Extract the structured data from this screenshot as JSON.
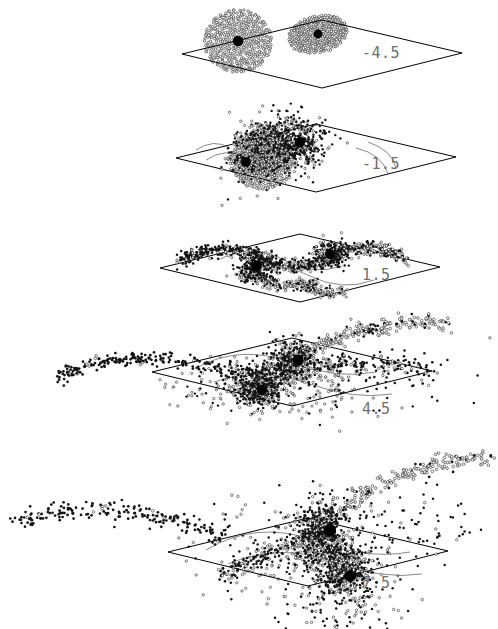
{
  "figure": {
    "kind": "n-body-galaxy-merger-sequence",
    "panel_count": 5,
    "background_color": "#ffffff",
    "ink_color": "#000000",
    "label_color": "#6e6e6e"
  },
  "panels": [
    {
      "id": "panel-1",
      "time_label": "-4.5",
      "label_x": 362,
      "label_y": 44,
      "stage_top": 0,
      "stage_height": 98,
      "plane": {
        "points": "182,54 322,20 462,53 322,88"
      },
      "orbits": [],
      "description": "two separate intact disk galaxies above the reference plane"
    },
    {
      "id": "panel-2",
      "time_label": "-1.5",
      "label_x": 362,
      "label_y": 155,
      "stage_top": 98,
      "stage_height": 112,
      "plane": {
        "points": "176,60 316,26 456,59 316,94"
      },
      "orbits": [
        "M 196,52 q 18,-12 34,-2",
        "M 206,62 q 20,-13 38,-3",
        "M 356,50 q 26,6 32,26",
        "M 368,44 q 24,8 28,26"
      ],
      "description": "disks merged into one overlapping blob with two dark cores"
    },
    {
      "id": "panel-3",
      "time_label": "1.5",
      "label_x": 362,
      "label_y": 266,
      "stage_top": 210,
      "stage_height": 108,
      "plane": {
        "points": "160,58 300,24 440,57 300,92"
      },
      "orbits": [
        "M 218,50 q 34,-18 66,0 q 30,16 58,6",
        "M 238,62 q 40,-12 72,4 q 32,16 64,4"
      ],
      "description": "tidal arms develop into an S-shaped pair of curved streams"
    },
    {
      "id": "panel-4",
      "time_label": "4.5",
      "label_x": 362,
      "label_y": 400,
      "stage_top": 310,
      "stage_height": 130,
      "plane": {
        "points": "152,62 292,28 432,61 292,96"
      },
      "orbits": [
        "M 196,58 q 44,-24 94,-6 q 46,18 86,10",
        "M 214,72 q 46,-16 96,2 q 44,16 82,10"
      ],
      "description": "long tidal tails extend far beyond the plane on both sides"
    },
    {
      "id": "panel-5",
      "time_label": "7.5",
      "label_x": 362,
      "label_y": 574,
      "stage_top": 430,
      "stage_height": 199,
      "plane": {
        "points": "168,122 308,88 448,121 308,156"
      },
      "orbits": [
        "M 206,120 q 50,-30 108,-10 q 52,20 96,12",
        "M 228,134 q 52,-22 106,-2 q 48,18 88,12"
      ],
      "description": "near-final merger with two close cores and wide scattered debris"
    }
  ],
  "legend": {
    "marker_open": "open-circle-particle",
    "marker_filled": "filled-dot-particle",
    "marker_core": "galaxy-nucleus"
  },
  "chart_data": {
    "type": "scatter",
    "title": "",
    "xlabel": "",
    "ylabel": "",
    "series_labels": [
      "time"
    ],
    "categories": [
      "-4.5",
      "-1.5",
      "1.5",
      "4.5",
      "7.5"
    ],
    "values": [
      -4.5,
      -1.5,
      1.5,
      4.5,
      7.5
    ],
    "legend_position": "right",
    "grid": false,
    "note": "Each frame is a projected 3D scatter of N-body particles with a reference plane."
  }
}
